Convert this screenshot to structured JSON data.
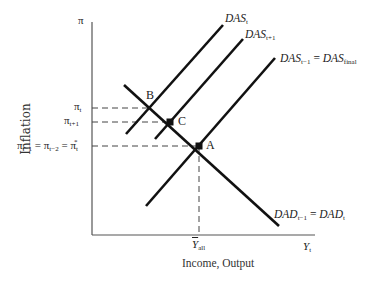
{
  "diagram": {
    "axes": {
      "y_axis_symbol": "π",
      "y_axis_title": "Inflation",
      "x_axis_symbol_main": "Y",
      "x_axis_symbol_sub": "t",
      "x_axis_title": "Income, Output"
    },
    "y_ticks": [
      {
        "main": "π",
        "sub": "t"
      },
      {
        "main": "π",
        "sub": "t+1"
      },
      {
        "text_a": "π",
        "sub_a": "t−1",
        "eq1": " = ",
        "text_b": "π",
        "sub_b": "t−2",
        "eq2": " = ",
        "text_c": "π",
        "sub_c": "t",
        "sup_c": "*"
      }
    ],
    "x_tick": {
      "main": "Y",
      "sub": "all",
      "overbar": true
    },
    "points": [
      {
        "label": "B"
      },
      {
        "label": "C"
      },
      {
        "label": "A"
      }
    ],
    "curves": {
      "das_t": {
        "main": "DAS",
        "sub": "t"
      },
      "das_t1": {
        "main": "DAS",
        "sub": "t+1"
      },
      "das_final": {
        "main_a": "DAS",
        "sub_a": "t−1",
        "eq": " = ",
        "main_b": "DAS",
        "sub_b": "final"
      },
      "dad": {
        "main_a": "DAD",
        "sub_a": "t−1",
        "eq": " = ",
        "main_b": "DAD",
        "sub_b": "t"
      }
    },
    "colors": {
      "line": "#111111",
      "axis": "#555555",
      "dash": "#444444"
    }
  }
}
